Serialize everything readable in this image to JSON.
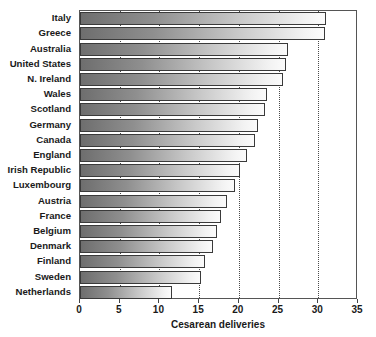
{
  "chart_data": {
    "type": "bar",
    "orientation": "horizontal",
    "title": "",
    "xlabel": "Cesarean deliveries",
    "ylabel": "",
    "xlim": [
      0,
      35
    ],
    "xticks": [
      0,
      5,
      10,
      15,
      20,
      25,
      30,
      35
    ],
    "xtick_labels": [
      "0",
      "5",
      "10",
      "15",
      "20",
      "25",
      "30",
      "35"
    ],
    "grid": "vertical-dotted",
    "legend": "none",
    "categories": [
      "Italy",
      "Greece",
      "Australia",
      "United States",
      "N. Ireland",
      "Wales",
      "Scotland",
      "Germany",
      "Canada",
      "England",
      "Irish Republic",
      "Luxembourg",
      "Austria",
      "France",
      "Belgium",
      "Denmark",
      "Finland",
      "Sweden",
      "Netherlands"
    ],
    "values": [
      31.0,
      30.8,
      26.2,
      25.9,
      25.5,
      23.5,
      23.3,
      22.4,
      22.0,
      21.0,
      20.2,
      19.5,
      18.5,
      17.8,
      17.3,
      16.8,
      15.8,
      15.2,
      11.6
    ],
    "colors": {
      "bar_gradient_start": "#6e6e6e",
      "bar_gradient_end": "#fbfbfb",
      "bar_border": "#3a3a3a",
      "gridline": "#4a4a4a",
      "axis": "#555555",
      "text": "#1a1a1a",
      "background": "#ffffff"
    }
  }
}
